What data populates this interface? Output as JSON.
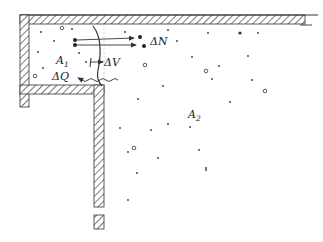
{
  "figure": {
    "type": "thermodynamic-subsystems",
    "colors": {
      "ink": "#333333",
      "hatch": "#444444",
      "background": "#ffffff"
    }
  },
  "labels": {
    "subsystem_1": {
      "symbol": "A",
      "sub": "1"
    },
    "subsystem_2": {
      "symbol": "A",
      "sub": "2"
    },
    "heat": "ΔQ",
    "volume": "ΔV",
    "particles": "ΔN"
  }
}
